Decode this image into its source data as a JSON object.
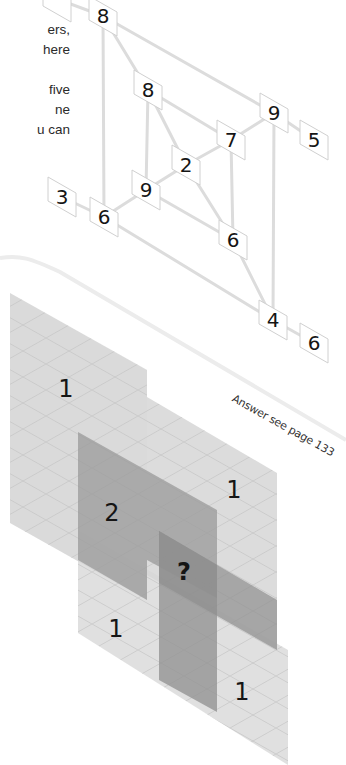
{
  "intro_text": {
    "lines": [
      "til",
      "ers,",
      "here",
      "",
      "five",
      "ne",
      "u can"
    ]
  },
  "puzzle_top": {
    "description": "Isometric network of numbered tiles connected by lines",
    "tiles": [
      {
        "id": "t0",
        "value": "",
        "x": 57,
        "y": 2
      },
      {
        "id": "t1",
        "value": "8",
        "x": 103,
        "y": 16
      },
      {
        "id": "t2",
        "value": "8",
        "x": 148,
        "y": 90
      },
      {
        "id": "t3",
        "value": "9",
        "x": 274,
        "y": 113
      },
      {
        "id": "t4",
        "value": "5",
        "x": 314,
        "y": 140
      },
      {
        "id": "t5",
        "value": "7",
        "x": 231,
        "y": 140
      },
      {
        "id": "t6",
        "value": "2",
        "x": 186,
        "y": 165
      },
      {
        "id": "t7",
        "value": "9",
        "x": 146,
        "y": 190
      },
      {
        "id": "t8",
        "value": "3",
        "x": 62,
        "y": 197
      },
      {
        "id": "t9",
        "value": "6",
        "x": 104,
        "y": 217
      },
      {
        "id": "t10",
        "value": "6",
        "x": 233,
        "y": 240
      },
      {
        "id": "t11",
        "value": "4",
        "x": 273,
        "y": 320
      },
      {
        "id": "t12",
        "value": "6",
        "x": 314,
        "y": 343
      }
    ]
  },
  "answer_note": "Answer see page 133",
  "puzzle_bottom": {
    "description": "Overlapping isometric grid planes with numbers",
    "cells": [
      {
        "id": "c1",
        "value": "1",
        "x": 66,
        "y": 397
      },
      {
        "id": "c2",
        "value": "1",
        "x": 234,
        "y": 498
      },
      {
        "id": "c3",
        "value": "2",
        "x": 112,
        "y": 521
      },
      {
        "id": "c4",
        "value": "?",
        "x": 184,
        "y": 580
      },
      {
        "id": "c5",
        "value": "1",
        "x": 116,
        "y": 637
      },
      {
        "id": "c6",
        "value": "1",
        "x": 242,
        "y": 700
      }
    ]
  },
  "colors": {
    "light_plane": "#d9d9d9",
    "dark_plane": "#9e9e9e",
    "line": "#dedede",
    "tile_border": "#cfcfcf",
    "text": "#151515"
  }
}
